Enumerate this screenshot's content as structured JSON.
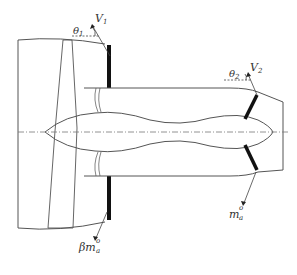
{
  "diagram": {
    "labels": {
      "theta1": "θ",
      "theta1_sub": "1",
      "v1": "V",
      "v1_sub": "1",
      "theta2": "θ",
      "theta2_sub": "2",
      "v2": "V",
      "v2_sub": "2",
      "core_mass_flow": "m",
      "core_mass_flow_sup": "o",
      "core_mass_flow_sub": "a",
      "bypass_mass_flow_prefix": "β",
      "bypass_mass_flow": "m",
      "bypass_mass_flow_sup": "o",
      "bypass_mass_flow_sub": "a"
    },
    "colors": {
      "line": "#555555",
      "thick": "#111111",
      "centerline": "#777777"
    }
  }
}
